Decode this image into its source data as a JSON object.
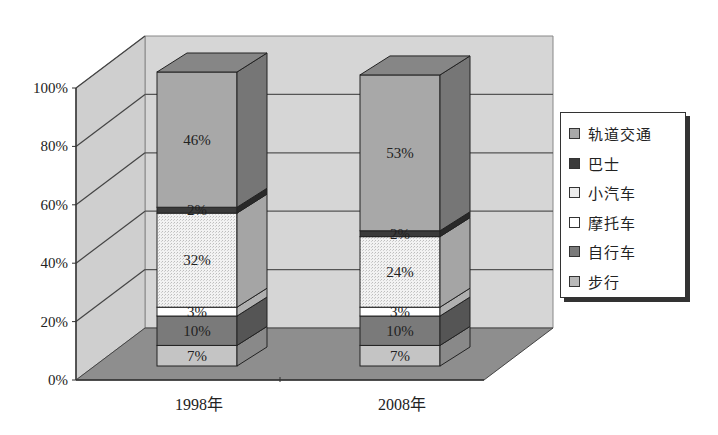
{
  "chart_data": {
    "type": "bar",
    "subtype": "stacked-100-3d",
    "title": "",
    "xlabel": "",
    "ylabel": "",
    "categories": [
      "1998年",
      "2008年"
    ],
    "y_ticks": [
      "0%",
      "20%",
      "40%",
      "60%",
      "80%",
      "100%"
    ],
    "ylim": [
      0,
      100
    ],
    "grid": true,
    "legend_position": "right",
    "series": [
      {
        "name": "步行",
        "values": [
          7,
          7
        ],
        "labels": [
          "7%",
          "7%"
        ],
        "color": "#c4c4c4"
      },
      {
        "name": "自行车",
        "values": [
          10,
          10
        ],
        "labels": [
          "10%",
          "10%"
        ],
        "color": "#7a7a7a"
      },
      {
        "name": "摩托车",
        "values": [
          3,
          3
        ],
        "labels": [
          "3%",
          "3%"
        ],
        "color": "#ffffff"
      },
      {
        "name": "小汽车",
        "values": [
          32,
          24
        ],
        "labels": [
          "32%",
          "24%"
        ],
        "color": "#ececec",
        "pattern": "dotted"
      },
      {
        "name": "巴士",
        "values": [
          2,
          2
        ],
        "labels": [
          "2%",
          "2%"
        ],
        "color": "#3a3a3a"
      },
      {
        "name": "轨道交通",
        "values": [
          46,
          53
        ],
        "labels": [
          "46%",
          "53%"
        ],
        "color": "#a8a8a8"
      }
    ]
  },
  "legend": {
    "items": [
      {
        "label": "轨道交通",
        "color": "#a8a8a8"
      },
      {
        "label": "巴士",
        "color": "#3a3a3a"
      },
      {
        "label": "小汽车",
        "color": "#ececec"
      },
      {
        "label": "摩托车",
        "color": "#ffffff"
      },
      {
        "label": "自行车",
        "color": "#7a7a7a"
      },
      {
        "label": "步行",
        "color": "#b8b8b8"
      }
    ]
  }
}
